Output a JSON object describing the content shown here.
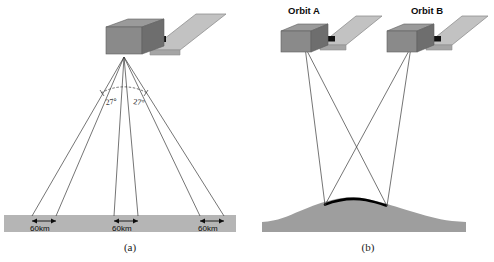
{
  "figure": {
    "background_color": "#ffffff"
  },
  "colors": {
    "satellite_body_top": "#9a9a9a",
    "satellite_body_front": "#8a8a8a",
    "satellite_body_side": "#6e6e6e",
    "solar_panel": "#c2c2c2",
    "solar_panel_edge": "#8f8f8f",
    "boom": "#111111",
    "ground_strip": "#b5b5b5",
    "terrain": "#9e9e9e",
    "ray_line": "#3a3a3a",
    "overlap_highlight": "#000000",
    "text": "#0d0d0d"
  },
  "panel_a": {
    "caption": "(a)",
    "angles": [
      {
        "id": "left-angle",
        "label": "27°",
        "value": 27,
        "unit": "degrees"
      },
      {
        "id": "right-angle",
        "label": "27°",
        "value": 27,
        "unit": "degrees"
      }
    ],
    "swaths": [
      {
        "id": "left-swath",
        "label": "60km",
        "value": 60,
        "unit": "km"
      },
      {
        "id": "nadir-swath",
        "label": "60km",
        "value": 60,
        "unit": "km"
      },
      {
        "id": "right-swath",
        "label": "60km",
        "value": 60,
        "unit": "km"
      }
    ],
    "satellite": {
      "name": "satellite",
      "count": 1
    },
    "ray_count": 6
  },
  "panel_b": {
    "caption": "(b)",
    "satellites": [
      {
        "id": "orbit-a",
        "label": "Orbit A"
      },
      {
        "id": "orbit-b",
        "label": "Orbit B"
      }
    ],
    "terrain": {
      "name": "hill",
      "overlap_marked": true
    },
    "ray_count": 4
  }
}
